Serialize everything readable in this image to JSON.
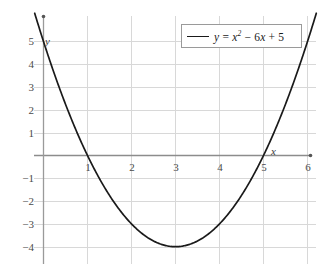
{
  "chart_data": {
    "type": "line",
    "title": "",
    "subtitle": "",
    "xlabel": "x",
    "ylabel": "y",
    "xlim": [
      -0.18,
      6.35
    ],
    "ylim": [
      -4.6,
      6.0
    ],
    "grid": true,
    "legend_position": "top-right",
    "xticks": [
      1,
      2,
      3,
      4,
      5,
      6
    ],
    "yticks": [
      5,
      4,
      3,
      2,
      1,
      -1,
      -2,
      -3,
      -4
    ],
    "xtick_labels": [
      "1",
      "2",
      "3",
      "4",
      "5",
      "6"
    ],
    "ytick_labels": [
      "5",
      "4",
      "3",
      "2",
      "1",
      "−1",
      "−2",
      "−3",
      "−4"
    ],
    "series": [
      {
        "name": "y = x² − 6x + 5",
        "equation": "y = x^2 - 6x + 5",
        "color": "#1a1a1a",
        "roots": [
          1,
          5
        ],
        "vertex": [
          3,
          -4
        ],
        "y_intercept": 5,
        "x": [
          -0.1,
          0.0,
          0.25,
          0.5,
          0.75,
          1.0,
          1.25,
          1.5,
          1.75,
          2.0,
          2.25,
          2.5,
          2.75,
          3.0,
          3.25,
          3.5,
          3.75,
          4.0,
          4.25,
          4.5,
          4.75,
          5.0,
          5.25,
          5.5,
          5.75,
          6.0,
          6.1
        ],
        "values": [
          5.61,
          5.0,
          3.5625,
          2.25,
          1.0625,
          0.0,
          -0.9375,
          -1.75,
          -2.4375,
          -3.0,
          -3.4375,
          -3.75,
          -3.9375,
          -4.0,
          -3.9375,
          -3.75,
          -3.4375,
          -3.0,
          -2.4375,
          -1.75,
          -0.9375,
          0.0,
          1.0625,
          2.25,
          3.5625,
          5.0,
          5.61
        ]
      }
    ]
  },
  "legend": {
    "entry_prefix": "y = ",
    "entry_base": "x",
    "entry_exponent": "2",
    "entry_suffix_a": " − 6",
    "entry_var": "x",
    "entry_suffix_b": " + 5",
    "entry_full": "y = x² − 6x + 5"
  },
  "axes": {
    "x_axis_name": "x",
    "y_axis_name": "y"
  }
}
